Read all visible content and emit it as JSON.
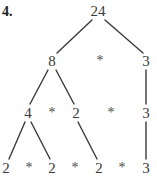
{
  "problem": {
    "label": "4."
  },
  "diagram": {
    "stroke_color": "#3a3a3a",
    "text_color": "#3a3a3a",
    "label_color": "#1a1a1a",
    "background": "#ffffff",
    "nodes": [
      {
        "id": "root",
        "text": "24",
        "x": 98,
        "y": 11,
        "kind": "number"
      },
      {
        "id": "l1a",
        "text": "8",
        "x": 52,
        "y": 61,
        "kind": "number"
      },
      {
        "id": "l1op",
        "text": "*",
        "x": 100,
        "y": 61,
        "kind": "operator"
      },
      {
        "id": "l1b",
        "text": "3",
        "x": 146,
        "y": 61,
        "kind": "number"
      },
      {
        "id": "l2a",
        "text": "4",
        "x": 28,
        "y": 113,
        "kind": "number"
      },
      {
        "id": "l2op1",
        "text": "*",
        "x": 52,
        "y": 113,
        "kind": "operator"
      },
      {
        "id": "l2b",
        "text": "2",
        "x": 76,
        "y": 113,
        "kind": "number"
      },
      {
        "id": "l2op2",
        "text": "*",
        "x": 111,
        "y": 113,
        "kind": "operator"
      },
      {
        "id": "l2c",
        "text": "3",
        "x": 146,
        "y": 113,
        "kind": "number"
      },
      {
        "id": "l3a",
        "text": "2",
        "x": 6,
        "y": 168,
        "kind": "number"
      },
      {
        "id": "l3op1",
        "text": "*",
        "x": 29,
        "y": 168,
        "kind": "operator"
      },
      {
        "id": "l3b",
        "text": "2",
        "x": 52,
        "y": 168,
        "kind": "number"
      },
      {
        "id": "l3op2",
        "text": "*",
        "x": 75,
        "y": 168,
        "kind": "operator"
      },
      {
        "id": "l3c",
        "text": "2",
        "x": 99,
        "y": 168,
        "kind": "number"
      },
      {
        "id": "l3op3",
        "text": "*",
        "x": 122,
        "y": 168,
        "kind": "operator"
      },
      {
        "id": "l3d",
        "text": "3",
        "x": 146,
        "y": 168,
        "kind": "number"
      }
    ],
    "edges": [
      {
        "from": "root",
        "to": "l1a",
        "x1": 92,
        "y1": 20,
        "x2": 57,
        "y2": 53
      },
      {
        "from": "root",
        "to": "l1b",
        "x1": 105,
        "y1": 20,
        "x2": 143,
        "y2": 53
      },
      {
        "from": "l1a",
        "to": "l2a",
        "x1": 48,
        "y1": 70,
        "x2": 30,
        "y2": 104
      },
      {
        "from": "l1a",
        "to": "l2b",
        "x1": 56,
        "y1": 70,
        "x2": 74,
        "y2": 104
      },
      {
        "from": "l1b",
        "to": "l2c",
        "x1": 146,
        "y1": 70,
        "x2": 146,
        "y2": 104
      },
      {
        "from": "l2a",
        "to": "l3a",
        "x1": 25,
        "y1": 122,
        "x2": 9,
        "y2": 159
      },
      {
        "from": "l2a",
        "to": "l3b",
        "x1": 31,
        "y1": 122,
        "x2": 50,
        "y2": 159
      },
      {
        "from": "l2b",
        "to": "l3c",
        "x1": 78,
        "y1": 122,
        "x2": 97,
        "y2": 159
      },
      {
        "from": "l2c",
        "to": "l3d",
        "x1": 146,
        "y1": 122,
        "x2": 146,
        "y2": 159
      }
    ]
  }
}
